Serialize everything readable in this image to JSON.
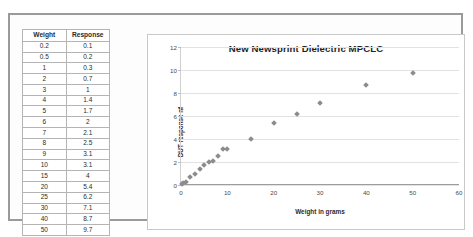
{
  "table": {
    "headers": [
      "Weight",
      "Response"
    ],
    "rows": [
      [
        "0.2",
        "0.1"
      ],
      [
        "0.5",
        "0.2"
      ],
      [
        "1",
        "0.3"
      ],
      [
        "2",
        "0.7"
      ],
      [
        "3",
        "1"
      ],
      [
        "4",
        "1.4"
      ],
      [
        "5",
        "1.7"
      ],
      [
        "6",
        "2"
      ],
      [
        "7",
        "2.1"
      ],
      [
        "8",
        "2.5"
      ],
      [
        "9",
        "3.1"
      ],
      [
        "10",
        "3.1"
      ],
      [
        "15",
        "4"
      ],
      [
        "20",
        "5.4"
      ],
      [
        "25",
        "6.2"
      ],
      [
        "30",
        "7.1"
      ],
      [
        "40",
        "8.7"
      ],
      [
        "50",
        "9.7"
      ]
    ]
  },
  "chart_data": {
    "type": "scatter",
    "title": "New Newsprint Dielectric MPCLC",
    "xlabel": "Weight in grams",
    "ylabel": "DUT response nf",
    "xlim": [
      0,
      60
    ],
    "ylim": [
      0,
      12
    ],
    "xticks": [
      "0",
      "10",
      "20",
      "30",
      "40",
      "50",
      "60"
    ],
    "yticks": [
      "0",
      "2",
      "4",
      "6",
      "8",
      "10",
      "12"
    ],
    "grid": "horizontal",
    "legend": "none",
    "marker_color": "#8c8c8c",
    "marker_shape": "diamond",
    "series": [
      {
        "name": "DUT response",
        "points": [
          [
            0.2,
            0.1
          ],
          [
            0.5,
            0.2
          ],
          [
            1,
            0.3
          ],
          [
            2,
            0.7
          ],
          [
            3,
            1
          ],
          [
            4,
            1.4
          ],
          [
            5,
            1.7
          ],
          [
            6,
            2
          ],
          [
            7,
            2.1
          ],
          [
            8,
            2.5
          ],
          [
            9,
            3.1
          ],
          [
            10,
            3.1
          ],
          [
            15,
            4
          ],
          [
            20,
            5.4
          ],
          [
            25,
            6.2
          ],
          [
            30,
            7.1
          ],
          [
            40,
            8.7
          ],
          [
            50,
            9.7
          ]
        ]
      }
    ]
  }
}
